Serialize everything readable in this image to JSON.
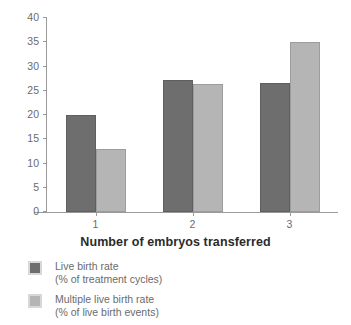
{
  "chart_data": {
    "type": "bar",
    "title": "",
    "xlabel": "Number of embryos transferred",
    "ylabel": "",
    "categories": [
      "1",
      "2",
      "3"
    ],
    "ylim": [
      0,
      40
    ],
    "yticks": [
      0,
      5,
      10,
      15,
      20,
      25,
      30,
      35,
      40
    ],
    "ytick_labels": [
      "0",
      "5",
      "10",
      "15",
      "20",
      "25",
      "30",
      "35",
      "40"
    ],
    "grid": false,
    "legend_position": "below-left",
    "series": [
      {
        "name": "Live birth rate",
        "sublabel": "(% of treatment cycles)",
        "color": "#6e6e6e",
        "values": [
          20.0,
          27.3,
          26.5
        ]
      },
      {
        "name": "Multiple live birth rate",
        "sublabel": "(% of live birth events)",
        "color": "#b5b5b5",
        "values": [
          13.0,
          26.3,
          35.0
        ]
      }
    ]
  },
  "colors": {
    "background": "#ffffff",
    "axis": "#9a9a9a",
    "tick_text": "#6b6b6b",
    "title_text": "#2b2b2b",
    "series_dark": "#6e6e6e",
    "series_light": "#b5b5b5"
  }
}
